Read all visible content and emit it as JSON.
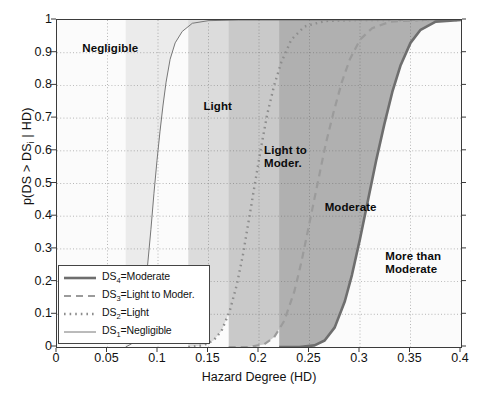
{
  "chart_data": {
    "type": "line",
    "title": "",
    "xlabel": "Hazard Degree (HD)",
    "ylabel": "p(DS > DS_i | HD)",
    "ylabel_parts": {
      "prefix": "p(DS > DS",
      "sub": "i",
      "suffix": " | HD)"
    },
    "xlim": [
      0,
      0.4
    ],
    "ylim": [
      0,
      1
    ],
    "xticks": [
      0,
      0.05,
      0.1,
      0.15,
      0.2,
      0.25,
      0.3,
      0.35,
      0.4
    ],
    "xticklabels": [
      "0",
      "0.05",
      "0.1",
      "0.15",
      "0.2",
      "0.25",
      "0.3",
      "0.35",
      "0.4"
    ],
    "yticks": [
      0,
      0.1,
      0.2,
      0.3,
      0.4,
      0.5,
      0.6,
      0.7,
      0.8,
      0.9,
      1
    ],
    "yticklabels": [
      "0",
      "0.1",
      "0.2",
      "0.3",
      "0.4",
      "0.5",
      "0.6",
      "0.7",
      "0.8",
      "0.9",
      "1"
    ],
    "grid": "dotted",
    "legend_position": "lower-left",
    "series": [
      {
        "name": "DS4=Moderate",
        "label_prefix": "DS",
        "label_sub": "4",
        "label_suffix": "=Moderate",
        "style": "thick-solid",
        "color": "#6e6e6e",
        "x": [
          0.22,
          0.24,
          0.255,
          0.265,
          0.275,
          0.285,
          0.292,
          0.3,
          0.308,
          0.316,
          0.324,
          0.332,
          0.34,
          0.35,
          0.36,
          0.375,
          0.4
        ],
        "y": [
          0.0,
          0.0,
          0.005,
          0.02,
          0.06,
          0.14,
          0.22,
          0.33,
          0.45,
          0.57,
          0.68,
          0.78,
          0.86,
          0.93,
          0.97,
          0.995,
          1.0
        ]
      },
      {
        "name": "DS3=Light to Moder.",
        "label_prefix": "DS",
        "label_sub": "3",
        "label_suffix": "=Light to Moder.",
        "style": "dashed",
        "color": "#9b9b9b",
        "x": [
          0.17,
          0.19,
          0.205,
          0.215,
          0.225,
          0.235,
          0.242,
          0.25,
          0.258,
          0.266,
          0.274,
          0.282,
          0.29,
          0.3,
          0.312,
          0.33,
          0.36,
          0.4
        ],
        "y": [
          0.0,
          0.0,
          0.008,
          0.03,
          0.08,
          0.17,
          0.26,
          0.38,
          0.5,
          0.62,
          0.72,
          0.81,
          0.88,
          0.94,
          0.975,
          0.995,
          1.0,
          1.0
        ]
      },
      {
        "name": "DS2=Light",
        "label_prefix": "DS",
        "label_sub": "2",
        "label_suffix": "=Light",
        "style": "dotted",
        "color": "#8d8d8d",
        "x": [
          0.13,
          0.145,
          0.155,
          0.163,
          0.171,
          0.178,
          0.184,
          0.19,
          0.196,
          0.202,
          0.208,
          0.215,
          0.222,
          0.232,
          0.245,
          0.265,
          0.3,
          0.4
        ],
        "y": [
          0.0,
          0.005,
          0.02,
          0.05,
          0.11,
          0.19,
          0.28,
          0.39,
          0.5,
          0.61,
          0.71,
          0.8,
          0.87,
          0.94,
          0.98,
          0.997,
          1.0,
          1.0
        ]
      },
      {
        "name": "DS1=Negligible",
        "label_prefix": "DS",
        "label_sub": "1",
        "label_suffix": "=Negligible",
        "style": "thin-solid",
        "color": "#777777",
        "x": [
          0.068,
          0.074,
          0.079,
          0.083,
          0.087,
          0.09,
          0.093,
          0.096,
          0.099,
          0.102,
          0.105,
          0.108,
          0.112,
          0.117,
          0.124,
          0.134,
          0.15,
          0.18,
          0.25,
          0.4
        ],
        "y": [
          0.0,
          0.01,
          0.04,
          0.09,
          0.17,
          0.26,
          0.36,
          0.47,
          0.57,
          0.66,
          0.74,
          0.81,
          0.88,
          0.93,
          0.965,
          0.99,
          0.998,
          1.0,
          1.0,
          1.0
        ]
      }
    ],
    "regions": [
      {
        "name": "Negligible",
        "label": "Negligible",
        "x": 0.025,
        "y": 0.91,
        "fill": "#fbfbfb"
      },
      {
        "name": "Light",
        "label": "Light",
        "x": 0.145,
        "y": 0.735,
        "fill": "#ebebeb"
      },
      {
        "name": "Light to Moder.",
        "label": "Light to\nModer.",
        "x": 0.205,
        "y": 0.6,
        "fill": "#dcdcdc"
      },
      {
        "name": "Moderate",
        "label": "Moderate",
        "x": 0.265,
        "y": 0.425,
        "fill": "#c9c9c9"
      },
      {
        "name": "More than Moderate",
        "label": "More than\nModerate",
        "x": 0.325,
        "y": 0.275,
        "fill": "#b0b0b0"
      }
    ]
  },
  "figure": {
    "caption": ""
  }
}
